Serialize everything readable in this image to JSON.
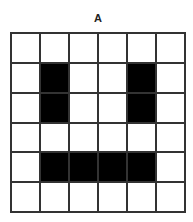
{
  "title": "A",
  "grid": {
    "rows": 6,
    "cols": 6,
    "filled_color": "#000000",
    "empty_color": "#ffffff",
    "cells": [
      [
        0,
        0,
        0,
        0,
        0,
        0
      ],
      [
        0,
        1,
        0,
        0,
        1,
        0
      ],
      [
        0,
        1,
        0,
        0,
        1,
        0
      ],
      [
        0,
        0,
        0,
        0,
        0,
        0
      ],
      [
        0,
        1,
        1,
        1,
        1,
        0
      ],
      [
        0,
        0,
        0,
        0,
        0,
        0
      ]
    ]
  }
}
